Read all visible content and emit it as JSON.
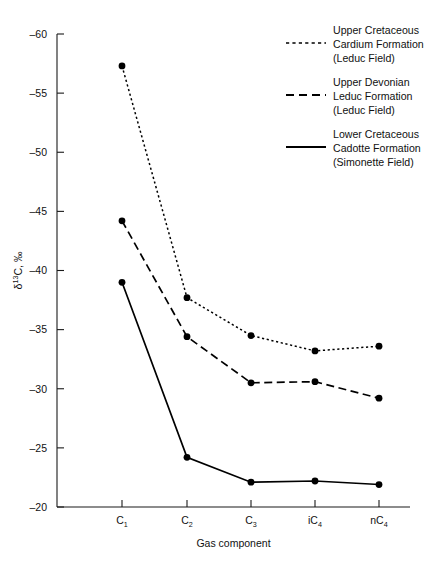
{
  "chart_data": {
    "type": "line",
    "title": "",
    "xlabel": "Gas component",
    "ylabel": "δ¹³C, ‰",
    "categories": [
      "C1",
      "C2",
      "C3",
      "iC4",
      "nC4"
    ],
    "category_labels": [
      "C",
      "C",
      "C",
      "iC",
      "nC"
    ],
    "category_subscripts": [
      "1",
      "2",
      "3",
      "4",
      "4"
    ],
    "ylim": [
      -60,
      -20
    ],
    "yticks": [
      -60,
      -55,
      -50,
      -45,
      -40,
      -35,
      -30,
      -25,
      -20
    ],
    "ytick_labels": [
      "–60",
      "–55",
      "–50",
      "–45",
      "–40",
      "–35",
      "–30",
      "–25",
      "–20"
    ],
    "y_axis_inverted": true,
    "grid": false,
    "legend_position": "top-right",
    "series": [
      {
        "name": "Upper Cretaceous Cardium Formation (Leduc Field)",
        "style": "dotted",
        "values": [
          -57.3,
          -37.7,
          -34.5,
          -33.2,
          -33.6
        ]
      },
      {
        "name": "Upper Devonian Leduc Formation (Leduc Field)",
        "style": "dashed",
        "values": [
          -44.2,
          -34.4,
          -30.5,
          -30.6,
          -29.2
        ]
      },
      {
        "name": "Lower Cretaceous Cadotte Formation (Simonette Field)",
        "style": "solid",
        "values": [
          -39.0,
          -24.2,
          -22.1,
          -22.2,
          -21.9
        ]
      }
    ]
  },
  "legend": {
    "entries": [
      {
        "style": "dotted",
        "line1": "Upper Cretaceous",
        "line2": "Cardium Formation",
        "line3": "(Leduc Field)"
      },
      {
        "style": "dashed",
        "line1": "Upper Devonian",
        "line2": "Leduc Formation",
        "line3": "(Leduc Field)"
      },
      {
        "style": "solid",
        "line1": "Lower Cretaceous",
        "line2": "Cadotte Formation",
        "line3": "(Simonette Field)"
      }
    ]
  },
  "axes": {
    "x_title": "Gas component",
    "y_title_delta": "δ",
    "y_title_sup": "13",
    "y_title_rest": "C, ‰"
  }
}
